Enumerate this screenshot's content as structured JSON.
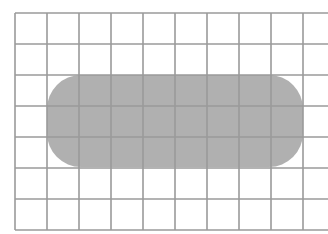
{
  "diagram": {
    "type": "grid-with-rounded-rectangle",
    "grid": {
      "line_color": "#9a9a9a",
      "vertical_lines_x": [
        15,
        47,
        79,
        111,
        143,
        175,
        207,
        239,
        271,
        303
      ],
      "horizontal_lines_y": [
        13,
        44,
        75,
        106,
        137,
        168,
        199,
        230
      ],
      "h_line_x_start": 15,
      "h_line_x_end": 328,
      "v_line_y_start": 13,
      "v_line_y_end": 230
    },
    "shape": {
      "kind": "rounded-rectangle",
      "fill": "#a9a9a9",
      "opacity": 0.92,
      "x": 47,
      "y": 75,
      "width": 256,
      "height": 92,
      "corner_radius": 34
    }
  }
}
